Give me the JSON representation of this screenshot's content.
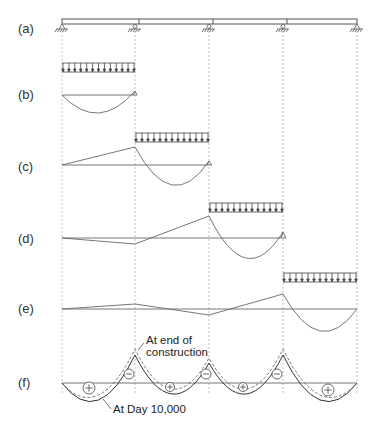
{
  "rows": [
    {
      "id": "a",
      "label": "(a)",
      "y": 30
    },
    {
      "id": "b",
      "label": "(b)",
      "y": 95
    },
    {
      "id": "c",
      "label": "(c)",
      "y": 167
    },
    {
      "id": "d",
      "label": "(d)",
      "y": 238
    },
    {
      "id": "e",
      "label": "(e)",
      "y": 309
    },
    {
      "id": "f",
      "label": "(f)",
      "y": 383
    }
  ],
  "supports_x": [
    62,
    135,
    209,
    283,
    357
  ],
  "annotations": {
    "end_of_construction": "At end of\nconstruction",
    "end_line1": "At end of",
    "end_line2": "construction",
    "day_10000": "At Day 10,000"
  },
  "signs": [
    {
      "symbol": "+",
      "x": 89,
      "y": 388,
      "r": 6
    },
    {
      "symbol": "−",
      "x": 129,
      "y": 374,
      "r": 5
    },
    {
      "symbol": "+",
      "x": 170,
      "y": 387,
      "r": 4.5
    },
    {
      "symbol": "−",
      "x": 206,
      "y": 374,
      "r": 5
    },
    {
      "symbol": "+",
      "x": 243,
      "y": 387,
      "r": 4.5
    },
    {
      "symbol": "−",
      "x": 277,
      "y": 374,
      "r": 5
    },
    {
      "symbol": "+",
      "x": 328,
      "y": 390,
      "r": 6
    }
  ],
  "colors": {
    "line": "#555555",
    "dashed": "#999999",
    "text": "#222222"
  }
}
